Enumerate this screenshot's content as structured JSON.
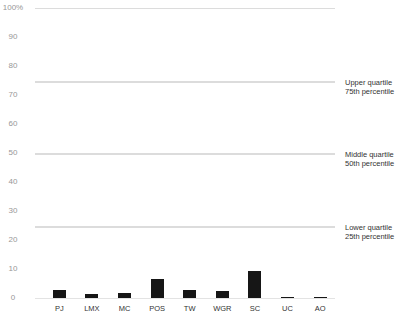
{
  "chart_data": {
    "type": "bar",
    "title": "",
    "xlabel": "",
    "ylabel": "",
    "categories": [
      "PJ",
      "LMX",
      "MC",
      "POS",
      "TW",
      "WGR",
      "SC",
      "UC",
      "AO"
    ],
    "values": [
      2.8,
      1.3,
      1.6,
      6.5,
      2.9,
      2.3,
      9.4,
      0.4,
      0.3
    ],
    "ylim": [
      0,
      100
    ],
    "ytick_values": [
      100,
      90,
      80,
      70,
      60,
      50,
      40,
      30,
      20,
      10,
      0
    ],
    "ytick_labels": [
      "100%",
      "90",
      "80",
      "70",
      "60",
      "50",
      "40",
      "30",
      "20",
      "10",
      "0"
    ],
    "grid": true,
    "legend": "none",
    "bar_color": "#161616",
    "gridline_color": "#dcdcdc",
    "ytick_color": "#979797",
    "xtick_color": "#333333",
    "annotation_color": "#333333",
    "reference_lines": [
      {
        "value": 100,
        "line1": "",
        "line2": ""
      },
      {
        "value": 75,
        "line1": "Upper quartile",
        "line2": "75th percentile"
      },
      {
        "value": 50,
        "line1": "Middle quartile",
        "line2": "50th percentile"
      },
      {
        "value": 25,
        "line1": "Lower quartile",
        "line2": "25th percentile"
      }
    ]
  }
}
